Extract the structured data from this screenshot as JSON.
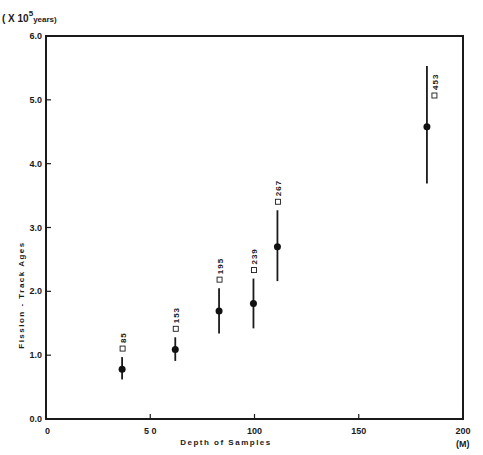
{
  "chart_data": {
    "type": "scatter",
    "title": "",
    "xlabel": "Depth of Samples",
    "x_unit": "(M)",
    "ylabel": "Fission - Track Ages",
    "y_unit_prefix": "( X 10",
    "y_unit_exp": "5",
    "y_unit_suffix": "years)",
    "xlim": [
      0,
      200
    ],
    "ylim": [
      0.0,
      6.0
    ],
    "x_ticks": [
      "0",
      "5 0",
      "100",
      "150",
      "200"
    ],
    "x_tick_values": [
      0,
      50,
      100,
      150,
      200
    ],
    "y_ticks": [
      "0.0",
      "1.0",
      "2.0",
      "3.0",
      "4.0",
      "5.0",
      "6.0"
    ],
    "y_tick_values": [
      0,
      1,
      2,
      3,
      4,
      5,
      6
    ],
    "grid": false,
    "series": [
      {
        "name": "Fission-track ages",
        "points": [
          {
            "x": 36.5,
            "y": 0.78,
            "err_low": 0.62,
            "err_high": 0.97,
            "label": "85"
          },
          {
            "x": 62,
            "y": 1.09,
            "err_low": 0.91,
            "err_high": 1.28,
            "label": "153"
          },
          {
            "x": 83,
            "y": 1.69,
            "err_low": 1.34,
            "err_high": 2.05,
            "label": "195"
          },
          {
            "x": 99.5,
            "y": 1.81,
            "err_low": 1.42,
            "err_high": 2.2,
            "label": "239"
          },
          {
            "x": 111,
            "y": 2.7,
            "err_low": 2.16,
            "err_high": 3.27,
            "label": "267"
          },
          {
            "x": 182.7,
            "y": 4.58,
            "err_low": 3.69,
            "err_high": 5.53,
            "label": "453"
          }
        ]
      }
    ]
  }
}
